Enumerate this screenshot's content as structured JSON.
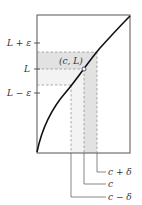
{
  "diagram": {
    "type": "epsilon-delta limit illustration",
    "y_labels": {
      "upper": "L + ε",
      "middle": "L",
      "lower": "L − ε"
    },
    "point_label": "(c, L)",
    "x_labels": {
      "right": "c + δ",
      "middle": "c",
      "left": "c − δ"
    },
    "colors": {
      "curve": "#111111",
      "frame": "#555555",
      "dashed": "#888888",
      "shade_dark": "#e2e2e2",
      "shade_light": "#f1f1f1",
      "text": "#333333"
    }
  }
}
